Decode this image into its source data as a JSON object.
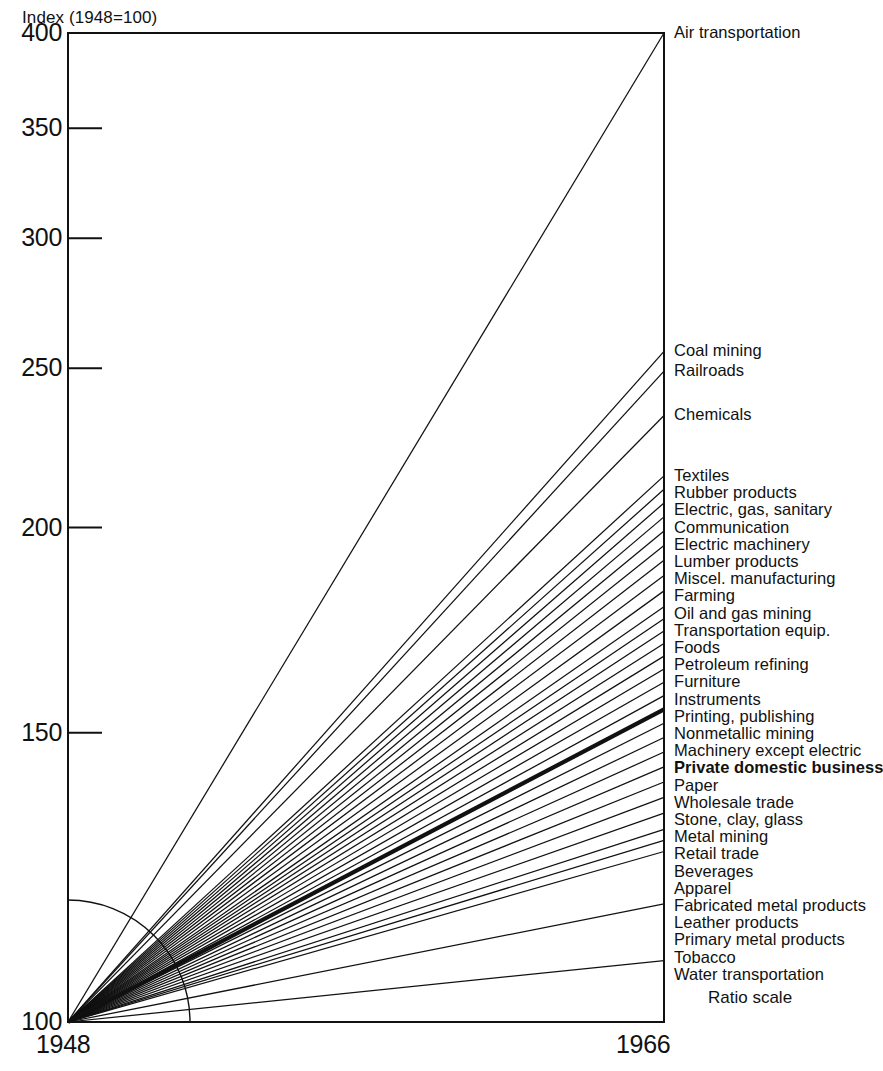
{
  "chart_data": {
    "type": "line",
    "title": "",
    "ylabel": "Index (1948=100)",
    "xlabel": "",
    "note": "Ratio scale",
    "scale": "log",
    "x": [
      1948,
      1966
    ],
    "xticks": [
      "1948",
      "1966"
    ],
    "yticks": [
      100,
      150,
      200,
      250,
      300,
      350,
      400
    ],
    "ytick_labels": [
      "100",
      "150",
      "200",
      "250",
      "300",
      "350",
      "400"
    ],
    "ylim": [
      100,
      400
    ],
    "base_value": 100,
    "grid": false,
    "legend": "right-endpoint-labels",
    "series": [
      {
        "name": "Air transportation",
        "values": [
          100,
          400
        ],
        "end": 400,
        "bold": false
      },
      {
        "name": "Coal mining",
        "values": [
          100,
          256
        ],
        "end": 256,
        "bold": false
      },
      {
        "name": "Railroads",
        "values": [
          100,
          249
        ],
        "end": 249,
        "bold": false
      },
      {
        "name": "Chemicals",
        "values": [
          100,
          234
        ],
        "end": 234,
        "bold": false
      },
      {
        "name": "Textiles",
        "values": [
          100,
          215
        ],
        "end": 215,
        "bold": false
      },
      {
        "name": "Rubber products",
        "values": [
          100,
          211
        ],
        "end": 211,
        "bold": false
      },
      {
        "name": "Electric, gas, sanitary",
        "values": [
          100,
          207
        ],
        "end": 207,
        "bold": false
      },
      {
        "name": "Communication",
        "values": [
          100,
          203
        ],
        "end": 203,
        "bold": false
      },
      {
        "name": "Electric machinery",
        "values": [
          100,
          199
        ],
        "end": 199,
        "bold": false
      },
      {
        "name": "Lumber products",
        "values": [
          100,
          195
        ],
        "end": 195,
        "bold": false
      },
      {
        "name": "Miscel. manufacturing",
        "values": [
          100,
          191
        ],
        "end": 191,
        "bold": false
      },
      {
        "name": "Farming",
        "values": [
          100,
          187
        ],
        "end": 187,
        "bold": false
      },
      {
        "name": "Oil and gas mining",
        "values": [
          100,
          183
        ],
        "end": 183,
        "bold": false
      },
      {
        "name": "Transportation equip.",
        "values": [
          100,
          179
        ],
        "end": 179,
        "bold": false
      },
      {
        "name": "Foods",
        "values": [
          100,
          176
        ],
        "end": 176,
        "bold": false
      },
      {
        "name": "Petroleum refining",
        "values": [
          100,
          173
        ],
        "end": 173,
        "bold": false
      },
      {
        "name": "Furniture",
        "values": [
          100,
          170
        ],
        "end": 170,
        "bold": false
      },
      {
        "name": "Instruments",
        "values": [
          100,
          167
        ],
        "end": 167,
        "bold": false
      },
      {
        "name": "Printing, publishing",
        "values": [
          100,
          164
        ],
        "end": 164,
        "bold": false
      },
      {
        "name": "Nonmetallic mining",
        "values": [
          100,
          161
        ],
        "end": 161,
        "bold": false
      },
      {
        "name": "Machinery except electric",
        "values": [
          100,
          158
        ],
        "end": 158,
        "bold": false
      },
      {
        "name": "Private domestic business",
        "values": [
          100,
          155
        ],
        "end": 155,
        "bold": true
      },
      {
        "name": "Paper",
        "values": [
          100,
          152
        ],
        "end": 152,
        "bold": false
      },
      {
        "name": "Wholesale trade",
        "values": [
          100,
          149
        ],
        "end": 149,
        "bold": false
      },
      {
        "name": "Stone, clay, glass",
        "values": [
          100,
          146
        ],
        "end": 146,
        "bold": false
      },
      {
        "name": "Metal mining",
        "values": [
          100,
          143
        ],
        "end": 143,
        "bold": false
      },
      {
        "name": "Retail trade",
        "values": [
          100,
          140
        ],
        "end": 140,
        "bold": false
      },
      {
        "name": "Beverages",
        "values": [
          100,
          137
        ],
        "end": 137,
        "bold": false
      },
      {
        "name": "Apparel",
        "values": [
          100,
          134
        ],
        "end": 134,
        "bold": false
      },
      {
        "name": "Fabricated metal products",
        "values": [
          100,
          131
        ],
        "end": 131,
        "bold": false
      },
      {
        "name": "Leather products",
        "values": [
          100,
          129
        ],
        "end": 129,
        "bold": false
      },
      {
        "name": "Primary metal products",
        "values": [
          100,
          127
        ],
        "end": 127,
        "bold": false
      },
      {
        "name": "Tobacco",
        "values": [
          100,
          118
        ],
        "end": 118,
        "bold": false
      },
      {
        "name": "Water transportation",
        "values": [
          100,
          109
        ],
        "end": 109,
        "bold": false
      }
    ]
  },
  "axis": {
    "y_title": "Index (1948=100)",
    "x_start": "1948",
    "x_end": "1966",
    "ratio_note": "Ratio scale"
  }
}
